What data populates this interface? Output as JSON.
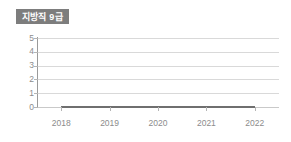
{
  "badge": {
    "label": "지방직 9급"
  },
  "chart_data": {
    "type": "line",
    "title": "지방직 9급",
    "xlabel": "",
    "ylabel": "",
    "categories": [
      "2018",
      "2019",
      "2020",
      "2021",
      "2022"
    ],
    "x": [
      2018,
      2019,
      2020,
      2021,
      2022
    ],
    "series": [
      {
        "name": "지방직 9급",
        "values": [
          0,
          0,
          0,
          0,
          0
        ],
        "color": "#6f6f6f"
      }
    ],
    "ylim": [
      0,
      5
    ],
    "yticks": [
      0,
      1,
      2,
      3,
      4,
      5
    ],
    "ytick_labels": [
      "0",
      "1",
      "2",
      "3",
      "4",
      "5"
    ],
    "xtick_labels": [
      "2018",
      "2019",
      "2020",
      "2021",
      "2022"
    ],
    "grid": true,
    "grid_axis": "y",
    "grid_color": "#d9d9d9",
    "legend": false,
    "legend_position": "none",
    "background": "#ffffff",
    "axis_color": "#9a9a9a",
    "tick_label_color": "#8c8c8c",
    "badge_background": "#7d7d7d",
    "badge_text_color": "#ffffff"
  }
}
